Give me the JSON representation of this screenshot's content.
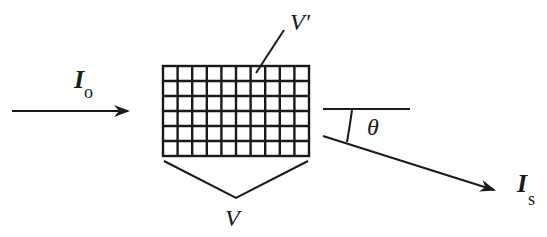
{
  "diagram": {
    "stroke_color": "#1a1a1a",
    "background": "#ffffff",
    "incident": {
      "symbol": "I",
      "subscript": "o",
      "description": "incident intensity arrow"
    },
    "scattered": {
      "symbol": "I",
      "subscript": "s",
      "description": "scattered intensity arrow"
    },
    "angle": {
      "symbol": "θ",
      "description": "scattering angle"
    },
    "volume": {
      "label": "V",
      "description": "total scattering volume (bracket)"
    },
    "subvolume": {
      "label": "V′",
      "description": "single volume element (grid cell)"
    },
    "grid": {
      "columns": 10,
      "rows": 6
    }
  }
}
